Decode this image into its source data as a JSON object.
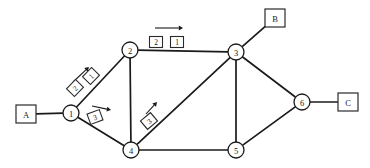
{
  "diagram": {
    "type": "packet-switched-network",
    "title": "",
    "canvas": {
      "width": 370,
      "height": 168
    },
    "nodes": [
      {
        "id": "n1",
        "label": "1",
        "x": 71,
        "y": 113,
        "r": 8
      },
      {
        "id": "n2",
        "label": "2",
        "x": 130,
        "y": 50,
        "r": 8
      },
      {
        "id": "n3",
        "label": "3",
        "x": 236,
        "y": 52,
        "r": 8
      },
      {
        "id": "n4",
        "label": "4",
        "x": 131,
        "y": 150,
        "r": 8
      },
      {
        "id": "n5",
        "label": "5",
        "x": 236,
        "y": 150,
        "r": 8
      },
      {
        "id": "n6",
        "label": "6",
        "x": 302,
        "y": 102,
        "r": 8
      }
    ],
    "terminals": [
      {
        "id": "tA",
        "label": "A",
        "x": 26,
        "y": 114,
        "w": 20,
        "h": 18,
        "attached_to": "n1"
      },
      {
        "id": "tB",
        "label": "B",
        "x": 275,
        "y": 18,
        "w": 20,
        "h": 18,
        "attached_to": "n3"
      },
      {
        "id": "tC",
        "label": "C",
        "x": 348,
        "y": 102,
        "w": 20,
        "h": 18,
        "attached_to": "n6"
      }
    ],
    "links": [
      {
        "from": "tA",
        "to": "n1"
      },
      {
        "from": "n1",
        "to": "n2"
      },
      {
        "from": "n1",
        "to": "n4"
      },
      {
        "from": "n2",
        "to": "n3"
      },
      {
        "from": "n2",
        "to": "n4"
      },
      {
        "from": "n3",
        "to": "n4"
      },
      {
        "from": "n3",
        "to": "n5"
      },
      {
        "from": "n3",
        "to": "n6"
      },
      {
        "from": "n3",
        "to": "tB"
      },
      {
        "from": "n4",
        "to": "n5"
      },
      {
        "from": "n5",
        "to": "n6"
      },
      {
        "from": "n6",
        "to": "tC"
      }
    ],
    "packets": [
      {
        "id": "p-1to2-a",
        "label": "2",
        "x": 75,
        "y": 88,
        "rotation": -46,
        "on_link": "n1-n2"
      },
      {
        "id": "p-1to2-b",
        "label": "1",
        "x": 91,
        "y": 76,
        "rotation": -46,
        "on_link": "n1-n2"
      },
      {
        "id": "p-1to4",
        "label": "3",
        "x": 95,
        "y": 117,
        "rotation": -20,
        "on_link": "n1-n4"
      },
      {
        "id": "p-4to3",
        "label": "3",
        "x": 149,
        "y": 121,
        "rotation": -40,
        "on_link": "n4-n3"
      },
      {
        "id": "p-2to3-a",
        "label": "2",
        "x": 156,
        "y": 42,
        "rotation": 0,
        "on_link": "n2-n3"
      },
      {
        "id": "p-2to3-b",
        "label": "1",
        "x": 177,
        "y": 42,
        "rotation": 0,
        "on_link": "n2-n3"
      }
    ],
    "flow_arrows": [
      {
        "id": "arrow-1to2",
        "x1": 73,
        "y1": 82,
        "x2": 89,
        "y2": 67,
        "direction": "up-right"
      },
      {
        "id": "arrow-1to4",
        "x1": 92,
        "y1": 106,
        "x2": 111,
        "y2": 110,
        "direction": "right-down"
      },
      {
        "id": "arrow-4to3",
        "x1": 146,
        "y1": 114,
        "x2": 157,
        "y2": 102,
        "direction": "up-right"
      },
      {
        "id": "arrow-2to3",
        "x1": 155,
        "y1": 28,
        "x2": 183,
        "y2": 28,
        "direction": "right"
      }
    ],
    "colors": {
      "line": "#1a1a1a",
      "box_fill": "#ffffff",
      "box_stroke": "#2a2a2a",
      "background": "#ffffff"
    }
  }
}
